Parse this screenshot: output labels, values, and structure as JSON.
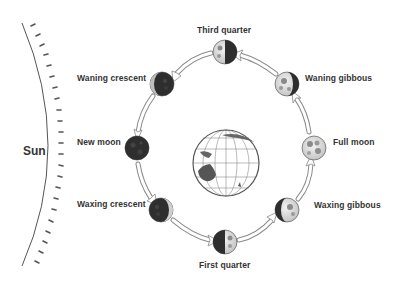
{
  "diagram": {
    "sun_label": "Sun",
    "earth": {
      "name": "Earth",
      "cx": 226,
      "cy": 163,
      "r": 33
    },
    "colors": {
      "text": "#333333",
      "moon_dark": "#2a2a2a",
      "moon_light": "#d9d9d9",
      "arrow_stroke": "#888888",
      "land": "#555555"
    },
    "phases": [
      {
        "label": "Third quarter",
        "cx": 225,
        "cy": 52
      },
      {
        "label": "Waning gibbous",
        "cx": 287,
        "cy": 84
      },
      {
        "label": "Full moon",
        "cx": 314,
        "cy": 148
      },
      {
        "label": "Waxing gibbous",
        "cx": 287,
        "cy": 210
      },
      {
        "label": "First quarter",
        "cx": 225,
        "cy": 242
      },
      {
        "label": "Waxing crescent",
        "cx": 161,
        "cy": 210
      },
      {
        "label": "New moon",
        "cx": 137,
        "cy": 148
      },
      {
        "label": "Waning crescent",
        "cx": 162,
        "cy": 84
      }
    ]
  }
}
